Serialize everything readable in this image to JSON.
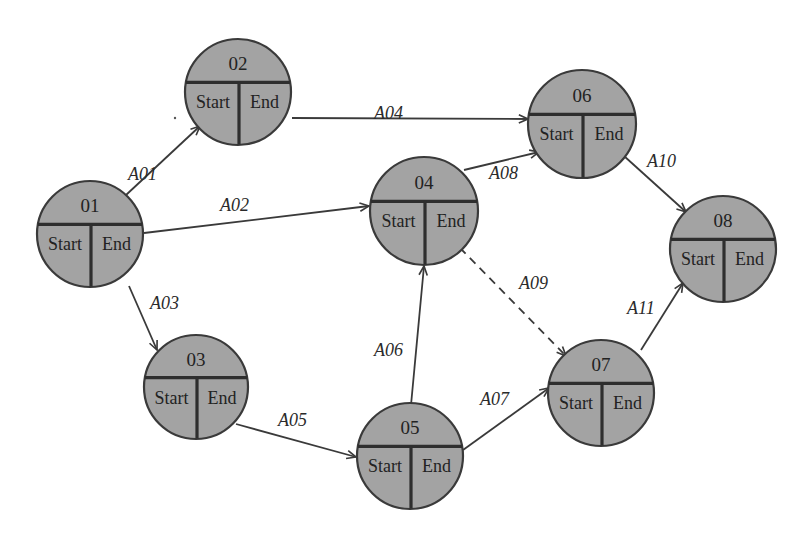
{
  "diagram": {
    "title": "",
    "colors": {
      "node_fill": "#a3a3a3",
      "node_stroke": "#3a3a3a",
      "edge": "#3a3a3a",
      "text": "#222222",
      "background": "#ffffff"
    },
    "field_labels": {
      "start": "Start",
      "end": "End"
    },
    "nodes": [
      {
        "id": "01",
        "label": "01",
        "start": "Start",
        "end": "End",
        "cx": 90,
        "cy": 234,
        "r": 53
      },
      {
        "id": "02",
        "label": "02",
        "start": "Start",
        "end": "End",
        "cx": 238,
        "cy": 92,
        "r": 53
      },
      {
        "id": "03",
        "label": "03",
        "start": "Start",
        "end": "End",
        "cx": 196,
        "cy": 387,
        "r": 52
      },
      {
        "id": "04",
        "label": "04",
        "start": "Start",
        "end": "End",
        "cx": 424,
        "cy": 211,
        "r": 54
      },
      {
        "id": "05",
        "label": "05",
        "start": "Start",
        "end": "End",
        "cx": 410,
        "cy": 456,
        "r": 53
      },
      {
        "id": "06",
        "label": "06",
        "start": "Start",
        "end": "End",
        "cx": 582,
        "cy": 124,
        "r": 54
      },
      {
        "id": "07",
        "label": "07",
        "start": "Start",
        "end": "End",
        "cx": 601,
        "cy": 393,
        "r": 53
      },
      {
        "id": "08",
        "label": "08",
        "start": "Start",
        "end": "End",
        "cx": 723,
        "cy": 249,
        "r": 53
      }
    ],
    "edges": [
      {
        "id": "A01",
        "label": "A01",
        "from": "01",
        "to": "02",
        "style": "solid",
        "x1": 126,
        "y1": 195,
        "x2": 200,
        "y2": 126,
        "lx": 128,
        "ly": 180
      },
      {
        "id": "A02",
        "label": "A02",
        "from": "01",
        "to": "04",
        "style": "solid",
        "x1": 144,
        "y1": 233,
        "x2": 369,
        "y2": 206,
        "lx": 220,
        "ly": 211
      },
      {
        "id": "A03",
        "label": "A03",
        "from": "01",
        "to": "03",
        "style": "solid",
        "x1": 129,
        "y1": 286,
        "x2": 157,
        "y2": 350,
        "lx": 150,
        "ly": 309
      },
      {
        "id": "A04",
        "label": "A04",
        "from": "02",
        "to": "06",
        "style": "solid",
        "x1": 292,
        "y1": 118,
        "x2": 528,
        "y2": 119,
        "lx": 374,
        "ly": 119
      },
      {
        "id": "A05",
        "label": "A05",
        "from": "03",
        "to": "05",
        "style": "solid",
        "x1": 236,
        "y1": 424,
        "x2": 356,
        "y2": 457,
        "lx": 278,
        "ly": 426
      },
      {
        "id": "A06",
        "label": "A06",
        "from": "05",
        "to": "04",
        "style": "solid",
        "x1": 411,
        "y1": 405,
        "x2": 424,
        "y2": 266,
        "lx": 374,
        "ly": 356
      },
      {
        "id": "A07",
        "label": "A07",
        "from": "05",
        "to": "07",
        "style": "solid",
        "x1": 463,
        "y1": 450,
        "x2": 549,
        "y2": 388,
        "lx": 480,
        "ly": 405
      },
      {
        "id": "A08",
        "label": "A08",
        "from": "04",
        "to": "06",
        "style": "solid",
        "x1": 464,
        "y1": 170,
        "x2": 539,
        "y2": 152,
        "lx": 489,
        "ly": 179
      },
      {
        "id": "A09",
        "label": "A09",
        "from": "04",
        "to": "07",
        "style": "dashed",
        "x1": 460,
        "y1": 248,
        "x2": 566,
        "y2": 356,
        "lx": 519,
        "ly": 289
      },
      {
        "id": "A10",
        "label": "A10",
        "from": "06",
        "to": "08",
        "style": "solid",
        "x1": 624,
        "y1": 156,
        "x2": 686,
        "y2": 212,
        "lx": 647,
        "ly": 167
      },
      {
        "id": "A11",
        "label": "A11",
        "from": "07",
        "to": "08",
        "style": "solid",
        "x1": 641,
        "y1": 350,
        "x2": 683,
        "y2": 283,
        "lx": 627,
        "ly": 314
      }
    ]
  }
}
